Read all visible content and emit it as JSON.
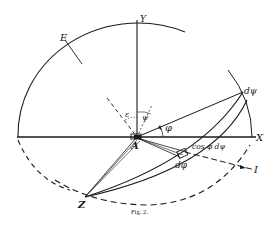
{
  "figure": {
    "caption": "Fig. 2.",
    "labels": {
      "Y": "Y",
      "X": "X",
      "E": "E",
      "A": "A",
      "Z": "Z",
      "I": "I",
      "epsilon": "ε",
      "psi": "ψ",
      "phi": "φ",
      "dpsi": "dψ",
      "dphi": "dφ",
      "cos_phi_dpsi": "cos φ dψ"
    },
    "colors": {
      "ink": "#1a1a1a",
      "background": "#ffffff"
    }
  }
}
